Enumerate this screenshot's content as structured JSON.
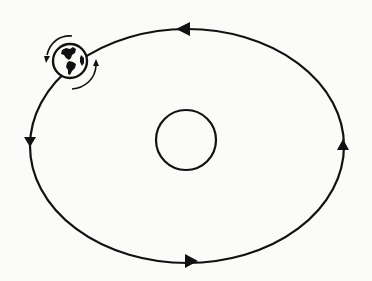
{
  "diagram": {
    "type": "orbit",
    "orbit": {
      "cx": 187,
      "cy": 146,
      "rx": 157,
      "ry": 117,
      "direction": "counterclockwise"
    },
    "sun": {
      "cx": 186,
      "cy": 140,
      "r": 30
    },
    "earth": {
      "cx": 70,
      "cy": 61,
      "r": 17,
      "rotation_arrows": 2
    },
    "arrows": [
      {
        "position": "top",
        "x": 185,
        "y": 29,
        "direction": "left"
      },
      {
        "position": "left",
        "x": 30,
        "y": 140,
        "direction": "down"
      },
      {
        "position": "bottom",
        "x": 190,
        "y": 261,
        "direction": "right"
      },
      {
        "position": "right",
        "x": 343,
        "y": 147,
        "direction": "up"
      }
    ],
    "colors": {
      "line": "#111111",
      "background": "#fbfbf9"
    }
  }
}
